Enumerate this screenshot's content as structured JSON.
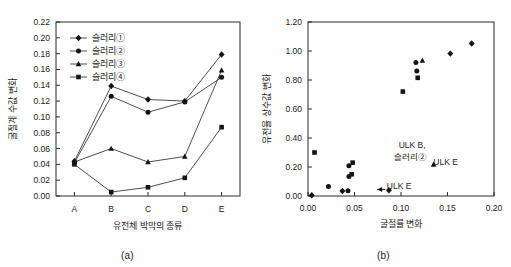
{
  "figure": {
    "background": "#ffffff",
    "ink_color": "#1a1a1a"
  },
  "panel_a": {
    "caption": "(a)",
    "legend": [
      {
        "label": "슬러리①",
        "marker": "diamond"
      },
      {
        "label": "슬러리②",
        "marker": "circle"
      },
      {
        "label": "슬러리③",
        "marker": "triangle"
      },
      {
        "label": "슬러리④",
        "marker": "square"
      }
    ]
  },
  "panel_b": {
    "caption": "(b)",
    "annotations": [
      {
        "text": "ULK B,",
        "x": 0.112,
        "y": 0.33
      },
      {
        "text": "슬러리②",
        "x": 0.11,
        "y": 0.245
      },
      {
        "text": "ULK E",
        "x": 0.148,
        "y": 0.215
      },
      {
        "text": "ULK E",
        "x": 0.098,
        "y": 0.045
      }
    ]
  },
  "chart_data": [
    {
      "type": "line",
      "panel": "a",
      "title": "",
      "xlabel": "유전체 박막의 종류",
      "ylabel": "굴절계 수값 변화",
      "categories": [
        "A",
        "B",
        "C",
        "D",
        "E"
      ],
      "ylim": [
        0.0,
        0.22
      ],
      "yticks": [
        0.0,
        0.02,
        0.04,
        0.06,
        0.08,
        0.1,
        0.12,
        0.14,
        0.16,
        0.18,
        0.2,
        0.22
      ],
      "ytick_labels": [
        "0.00",
        "0.02",
        "0.04",
        "0.06",
        "0.08",
        "0.10",
        "0.12",
        "0.14",
        "0.16",
        "0.18",
        "0.20",
        "0.22"
      ],
      "grid": false,
      "legend_position": "top-left",
      "series": [
        {
          "name": "슬러리①",
          "marker": "diamond",
          "values": [
            0.044,
            0.139,
            0.122,
            0.12,
            0.179
          ]
        },
        {
          "name": "슬러리②",
          "marker": "circle",
          "values": [
            0.042,
            0.126,
            0.106,
            0.119,
            0.15
          ]
        },
        {
          "name": "슬러리③",
          "marker": "triangle",
          "values": [
            0.043,
            0.06,
            0.043,
            0.05,
            0.159
          ]
        },
        {
          "name": "슬러리④",
          "marker": "square",
          "values": [
            0.04,
            0.005,
            0.011,
            0.023,
            0.087
          ]
        }
      ]
    },
    {
      "type": "scatter",
      "panel": "b",
      "title": "",
      "xlabel": "굴절률 변화",
      "ylabel": "유전율 상수값 변화",
      "xlim": [
        0.0,
        0.2
      ],
      "ylim": [
        0.0,
        1.2
      ],
      "xticks": [
        0.0,
        0.05,
        0.1,
        0.15,
        0.2
      ],
      "xtick_labels": [
        "0.00",
        "0.05",
        "0.10",
        "0.15",
        "0.20"
      ],
      "yticks": [
        0.0,
        0.2,
        0.4,
        0.6,
        0.8,
        1.0,
        1.2
      ],
      "ytick_labels": [
        "0.00",
        "0.20",
        "0.40",
        "0.60",
        "0.80",
        "1.00",
        "1.20"
      ],
      "grid": false,
      "legend_position": "none",
      "points": [
        {
          "x": 0.004,
          "y": 0.005,
          "marker": "diamond"
        },
        {
          "x": 0.007,
          "y": 0.3,
          "marker": "square"
        },
        {
          "x": 0.022,
          "y": 0.065,
          "marker": "circle"
        },
        {
          "x": 0.037,
          "y": 0.035,
          "marker": "diamond"
        },
        {
          "x": 0.043,
          "y": 0.037,
          "marker": "circle"
        },
        {
          "x": 0.044,
          "y": 0.135,
          "marker": "circle"
        },
        {
          "x": 0.044,
          "y": 0.208,
          "marker": "circle"
        },
        {
          "x": 0.047,
          "y": 0.15,
          "marker": "square"
        },
        {
          "x": 0.048,
          "y": 0.23,
          "marker": "square"
        },
        {
          "x": 0.102,
          "y": 0.72,
          "marker": "square"
        },
        {
          "x": 0.087,
          "y": 0.04,
          "marker": "diamond"
        },
        {
          "x": 0.116,
          "y": 0.92,
          "marker": "circle"
        },
        {
          "x": 0.117,
          "y": 0.862,
          "marker": "circle"
        },
        {
          "x": 0.118,
          "y": 0.815,
          "marker": "square"
        },
        {
          "x": 0.123,
          "y": 0.935,
          "marker": "triangle"
        },
        {
          "x": 0.135,
          "y": 0.218,
          "marker": "triangle"
        },
        {
          "x": 0.153,
          "y": 0.982,
          "marker": "diamond"
        },
        {
          "x": 0.176,
          "y": 1.052,
          "marker": "diamond"
        }
      ]
    }
  ]
}
